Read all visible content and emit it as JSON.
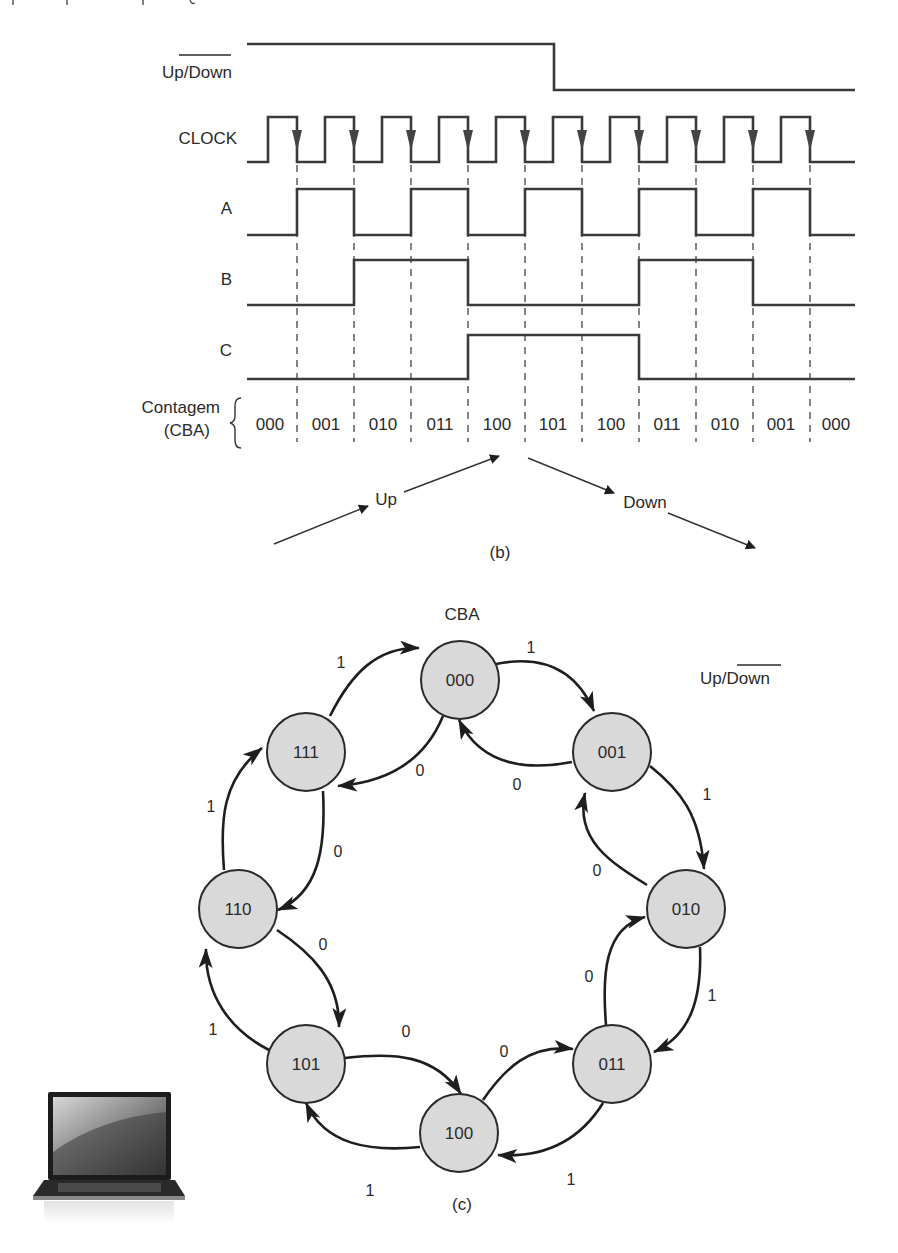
{
  "timing_diagram": {
    "caption": "(b)",
    "signals": [
      {
        "name": "up_down",
        "label_prefix": "Up/",
        "label_overlined": "Down",
        "levels": [
          1,
          1,
          1,
          1,
          1,
          0,
          0,
          0,
          0,
          0,
          0
        ]
      },
      {
        "name": "clock",
        "label": "CLOCK"
      },
      {
        "name": "A",
        "label": "A",
        "levels": [
          0,
          1,
          0,
          1,
          0,
          1,
          0,
          1,
          0,
          1,
          0
        ]
      },
      {
        "name": "B",
        "label": "B",
        "levels": [
          0,
          0,
          1,
          1,
          0,
          0,
          0,
          1,
          1,
          0,
          0
        ]
      },
      {
        "name": "C",
        "label": "C",
        "levels": [
          0,
          0,
          0,
          0,
          1,
          1,
          1,
          0,
          0,
          0,
          0
        ]
      }
    ],
    "count_label_line1": "Contagem",
    "count_label_line2": "(CBA)",
    "counts": [
      "000",
      "001",
      "010",
      "011",
      "100",
      "101",
      "100",
      "011",
      "010",
      "001",
      "000"
    ],
    "direction_up_label": "Up",
    "direction_down_label": "Down"
  },
  "state_diagram": {
    "caption": "(c)",
    "state_header": "CBA",
    "input_label_prefix": "Up/",
    "input_label_overlined": "Down",
    "states": [
      "000",
      "001",
      "010",
      "011",
      "100",
      "101",
      "110",
      "111"
    ],
    "transitions": [
      {
        "from": "000",
        "to": "001",
        "input": "1"
      },
      {
        "from": "001",
        "to": "010",
        "input": "1"
      },
      {
        "from": "010",
        "to": "011",
        "input": "1"
      },
      {
        "from": "011",
        "to": "100",
        "input": "1"
      },
      {
        "from": "100",
        "to": "101",
        "input": "1"
      },
      {
        "from": "101",
        "to": "110",
        "input": "1"
      },
      {
        "from": "110",
        "to": "111",
        "input": "1"
      },
      {
        "from": "111",
        "to": "000",
        "input": "1"
      },
      {
        "from": "000",
        "to": "111",
        "input": "0"
      },
      {
        "from": "111",
        "to": "110",
        "input": "0"
      },
      {
        "from": "110",
        "to": "101",
        "input": "0"
      },
      {
        "from": "101",
        "to": "100",
        "input": "0"
      },
      {
        "from": "100",
        "to": "011",
        "input": "0"
      },
      {
        "from": "011",
        "to": "010",
        "input": "0"
      },
      {
        "from": "010",
        "to": "001",
        "input": "0"
      },
      {
        "from": "001",
        "to": "000",
        "input": "0"
      }
    ]
  },
  "decoration": {
    "icon": "laptop-icon"
  }
}
